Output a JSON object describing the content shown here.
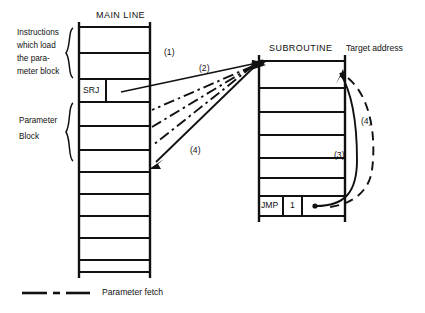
{
  "diagram": {
    "columns": {
      "main_line": {
        "header": "MAIN LINE",
        "cells": [
          {
            "label": ""
          },
          {
            "label": ""
          },
          {
            "label": "SRJ"
          },
          {
            "label": ""
          },
          {
            "label": ""
          },
          {
            "label": ""
          },
          {
            "label": ""
          },
          {
            "label": ""
          },
          {
            "label": ""
          },
          {
            "label": ""
          },
          {
            "label": ""
          }
        ],
        "srj_opcode": "SRJ"
      },
      "subroutine": {
        "header": "SUBROUTINE",
        "cells": [
          {
            "label": ""
          },
          {
            "label": ""
          },
          {
            "label": ""
          },
          {
            "label": ""
          },
          {
            "label": ""
          },
          {
            "label": ""
          },
          {
            "label": "JMP"
          }
        ],
        "jmp_opcode": "JMP",
        "jmp_operand": "1"
      }
    },
    "side_labels": {
      "instructions_line1": "Instructions",
      "instructions_line2": "which load",
      "instructions_line3": "the para-",
      "instructions_line4": "meter block",
      "parameter_line1": "Parameter",
      "parameter_line2": "Block"
    },
    "right_label": "Target address",
    "step_markers": {
      "one": "(1)",
      "two": "(2)",
      "three": "(3)",
      "four_left": "(4)",
      "four_right": "(4)"
    },
    "legend": {
      "text": "Parameter fetch"
    },
    "colors": {
      "ink": "#111111",
      "background": "#ffffff"
    }
  }
}
